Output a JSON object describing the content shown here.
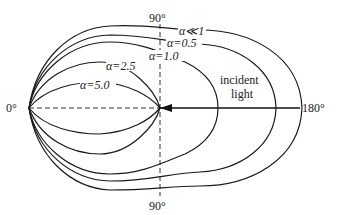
{
  "diagram": {
    "type": "polar-scattering-pattern",
    "angle_labels": {
      "top": "90°",
      "bottom": "90°",
      "left": "0°",
      "right": "180°"
    },
    "incident_label": [
      "incident",
      "light"
    ],
    "curves": [
      {
        "alpha_label": "α≪1"
      },
      {
        "alpha_label": "α=0.5"
      },
      {
        "alpha_label": "α=1.0"
      },
      {
        "alpha_label": "α=2.5"
      },
      {
        "alpha_label": "α=5.0"
      }
    ]
  }
}
